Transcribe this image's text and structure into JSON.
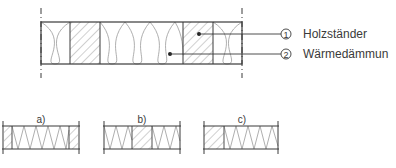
{
  "legend": [
    {
      "number": "1",
      "label": "Holzständer"
    },
    {
      "number": "2",
      "label": "Wärmedämmun"
    }
  ],
  "variants": [
    {
      "label": "a)"
    },
    {
      "label": "b)"
    },
    {
      "label": "c)"
    }
  ],
  "colors": {
    "line": "#3a3a3a",
    "hatch": "#8a8a8a",
    "insulation": "#9a9a9a"
  }
}
